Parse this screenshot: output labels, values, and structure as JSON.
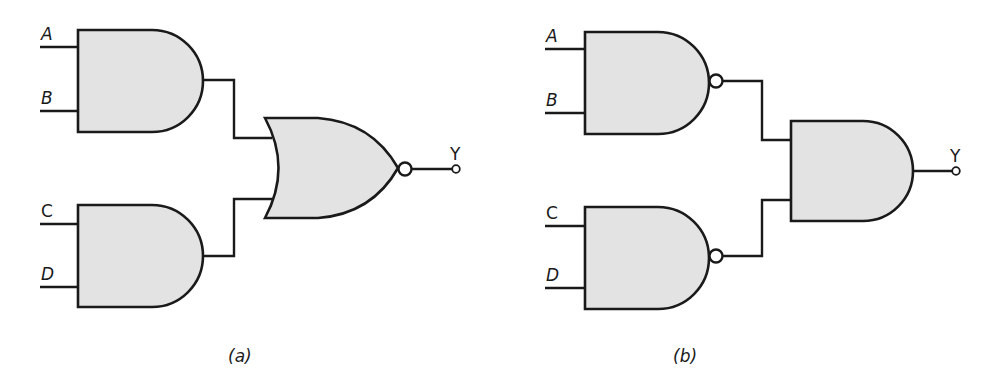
{
  "diagrams": [
    {
      "caption": "(a)",
      "inputs": [
        "A",
        "B",
        "C",
        "D"
      ],
      "output": "Y",
      "gates": [
        {
          "type": "AND",
          "inputs": [
            "A",
            "B"
          ]
        },
        {
          "type": "AND",
          "inputs": [
            "C",
            "D"
          ]
        },
        {
          "type": "NOR",
          "inputs": [
            "AND1",
            "AND2"
          ],
          "output": "Y"
        }
      ]
    },
    {
      "caption": "(b)",
      "inputs": [
        "A",
        "B",
        "C",
        "D"
      ],
      "output": "Y",
      "gates": [
        {
          "type": "NAND",
          "inputs": [
            "A",
            "B"
          ]
        },
        {
          "type": "NAND",
          "inputs": [
            "C",
            "D"
          ]
        },
        {
          "type": "AND",
          "inputs": [
            "NAND1",
            "NAND2"
          ],
          "output": "Y"
        }
      ]
    }
  ],
  "colors": {
    "gate_fill": "#e3e3e3",
    "stroke": "#1a1a1a",
    "background": "#ffffff"
  }
}
